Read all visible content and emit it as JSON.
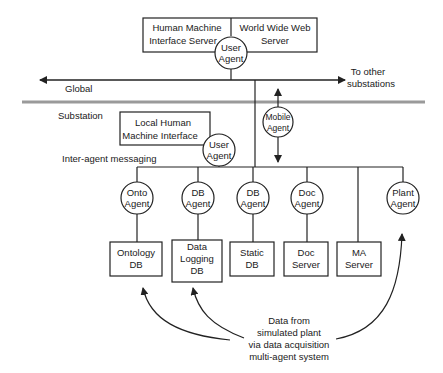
{
  "diagram": {
    "top_servers": {
      "hmi_server": [
        "Human Machine",
        "Interface Server"
      ],
      "www_server": [
        "World Wide Web",
        "Server"
      ],
      "user_agent": [
        "User",
        "Agent"
      ]
    },
    "global_network": {
      "label": "Global",
      "right_label": [
        "To other",
        "substations"
      ]
    },
    "substation": {
      "label": "Substation",
      "local_hmi": [
        "Local Human",
        "Machine Interface"
      ],
      "user_agent": [
        "User",
        "Agent"
      ],
      "mobile_agent": [
        "Mobile",
        "Agent"
      ],
      "messaging_label": "Inter-agent messaging"
    },
    "agents": [
      {
        "label": [
          "Onto",
          "Agent"
        ]
      },
      {
        "label": [
          "DB",
          "Agent"
        ]
      },
      {
        "label": [
          "DB",
          "Agent"
        ]
      },
      {
        "label": [
          "Doc",
          "Agent"
        ]
      },
      {
        "label": [
          "Plant",
          "Agent"
        ]
      }
    ],
    "stores": [
      {
        "label": [
          "Ontology",
          "DB"
        ]
      },
      {
        "label": [
          "Data",
          "Logging",
          "DB"
        ]
      },
      {
        "label": [
          "Static",
          "DB"
        ]
      },
      {
        "label": [
          "Doc",
          "Server"
        ]
      },
      {
        "label": [
          "MA",
          "Server"
        ]
      }
    ],
    "data_source": [
      "Data from",
      "simulated plant",
      "via data acquisition",
      "multi-agent system"
    ]
  }
}
